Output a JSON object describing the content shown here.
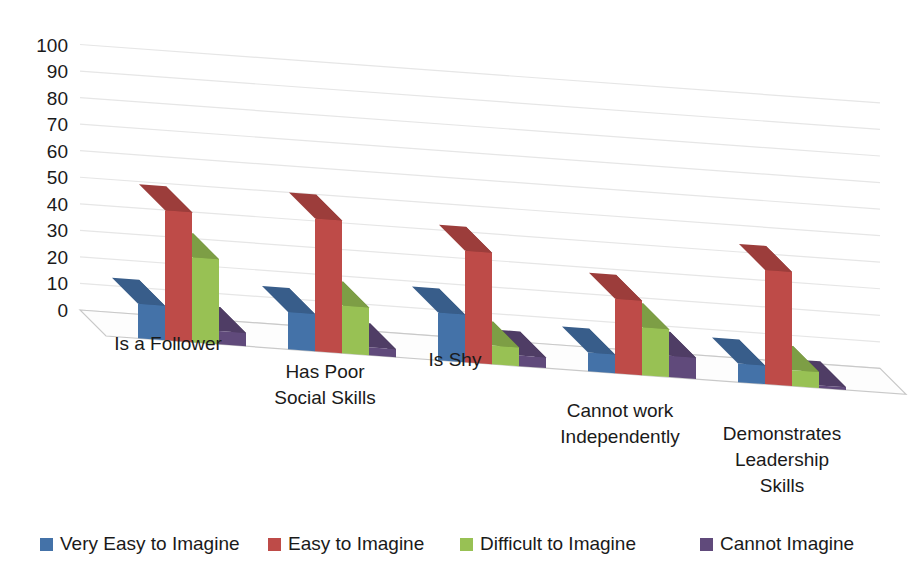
{
  "chart_data": {
    "type": "bar",
    "title": "",
    "subtitle": "",
    "xlabel": "",
    "ylabel": "",
    "ylim": [
      0,
      100
    ],
    "ytick_step": 10,
    "yticks": [
      "100",
      "90",
      "80",
      "70",
      "60",
      "50",
      "40",
      "30",
      "20",
      "10",
      "0"
    ],
    "grid": true,
    "three_d": true,
    "legend_position": "bottom",
    "categories": [
      "Is a Follower",
      "Has Poor\nSocial Skills",
      "Is Shy",
      "Cannot work\nIndependently",
      "Demonstrates\nLeadership\nSkills"
    ],
    "category_lines": [
      [
        "Is a Follower"
      ],
      [
        "Has Poor",
        "Social Skills"
      ],
      [
        "Is Shy"
      ],
      [
        "Cannot work",
        "Independently"
      ],
      [
        "Demonstrates",
        "Leadership",
        "Skills"
      ]
    ],
    "series": [
      {
        "name": "Very Easy to Imagine",
        "color": "#4472a8",
        "values": [
          13,
          14,
          18,
          7,
          7
        ]
      },
      {
        "name": "Easy to Imagine",
        "color": "#be4b48",
        "values": [
          49,
          50,
          42,
          28,
          43
        ]
      },
      {
        "name": "Difficult to Imagine",
        "color": "#98c154",
        "values": [
          32,
          18,
          7,
          18,
          6
        ]
      },
      {
        "name": "Cannot Imagine",
        "color": "#604a7b",
        "values": [
          5,
          3,
          4,
          8,
          1
        ]
      }
    ]
  },
  "legend": {
    "items": [
      {
        "label": "Very Easy to Imagine",
        "color": "#4472a8"
      },
      {
        "label": "Easy to Imagine",
        "color": "#be4b48"
      },
      {
        "label": "Difficult to Imagine",
        "color": "#98c154"
      },
      {
        "label": "Cannot Imagine",
        "color": "#604a7b"
      }
    ]
  },
  "style": {
    "background": "#ffffff",
    "gridline": "#e6e6e6",
    "floor": "#fdfdfd",
    "floor_edge": "#c9c9c9",
    "text": "#1a1a1a"
  }
}
